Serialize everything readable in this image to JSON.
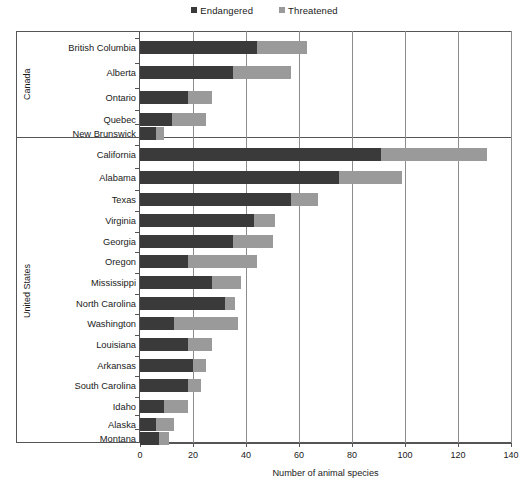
{
  "legend": {
    "entries": [
      {
        "label": "Endangered",
        "color": "#3a3a3a",
        "icon": "square-swatch-icon"
      },
      {
        "label": "Threatened",
        "color": "#9a9a9a",
        "icon": "square-swatch-icon"
      }
    ]
  },
  "axis": {
    "x_title": "Number of animal species",
    "ticks": [
      "0",
      "20",
      "40",
      "60",
      "80",
      "100",
      "120",
      "140"
    ]
  },
  "groups": [
    {
      "name": "Canada"
    },
    {
      "name": "United States"
    }
  ],
  "footnote": "",
  "chart_data": {
    "type": "bar",
    "orientation": "horizontal",
    "stacked": true,
    "title": "",
    "subtitle": "",
    "xlabel": "Number of animal species",
    "ylabel": "",
    "xlim": [
      0,
      140
    ],
    "xticks": [
      0,
      20,
      40,
      60,
      80,
      100,
      120,
      140
    ],
    "grid": "vertical",
    "legend_position": "top-center",
    "categories": [
      "British Columbia",
      "Alberta",
      "Ontario",
      "Quebec",
      "New Brunswick",
      "California",
      "Alabama",
      "Texas",
      "Virginia",
      "Georgia",
      "Oregon",
      "Mississippi",
      "North Carolina",
      "Washington",
      "Louisiana",
      "Arkansas",
      "South Carolina",
      "Idaho",
      "Alaska",
      "Montana"
    ],
    "group_membership": {
      "Canada": [
        "British Columbia",
        "Alberta",
        "Ontario",
        "Quebec",
        "New Brunswick"
      ],
      "United States": [
        "California",
        "Alabama",
        "Texas",
        "Virginia",
        "Georgia",
        "Oregon",
        "Mississippi",
        "North Carolina",
        "Washington",
        "Louisiana",
        "Arkansas",
        "South Carolina",
        "Idaho",
        "Alaska",
        "Montana"
      ]
    },
    "series": [
      {
        "name": "Endangered",
        "color": "#3a3a3a",
        "values": [
          44,
          35,
          18,
          12,
          6,
          91,
          75,
          57,
          43,
          35,
          18,
          27,
          32,
          13,
          18,
          20,
          18,
          9,
          6,
          7
        ]
      },
      {
        "name": "Threatened",
        "color": "#9a9a9a",
        "values": [
          19,
          22,
          9,
          13,
          3,
          40,
          24,
          10,
          8,
          15,
          26,
          11,
          4,
          24,
          9,
          5,
          5,
          9,
          7,
          4
        ]
      }
    ],
    "totals": [
      63,
      57,
      27,
      25,
      9,
      131,
      99,
      67,
      51,
      50,
      44,
      38,
      36,
      37,
      27,
      25,
      23,
      18,
      13,
      11
    ]
  }
}
